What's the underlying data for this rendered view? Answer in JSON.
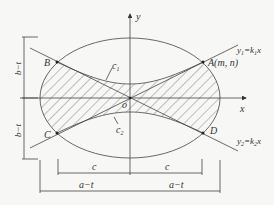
{
  "diagram": {
    "axes": {
      "x_label": "x",
      "y_label": "y",
      "origin_label": "o"
    },
    "points": {
      "A": "A(m, n)",
      "B": "B",
      "C": "C",
      "D": "D"
    },
    "curves": {
      "c1": "c",
      "c1_sub": "1",
      "c2": "c",
      "c2_sub": "2"
    },
    "lines": {
      "line1": {
        "lhs": "y",
        "lhs_sub": "1",
        "eq": "=k",
        "k_sub": "1",
        "rhs": "x"
      },
      "line2": {
        "lhs": "y",
        "lhs_sub": "2",
        "eq": "=k",
        "k_sub": "2",
        "rhs": "x"
      }
    },
    "dimensions": {
      "left_top": "b−t",
      "left_bottom": "b−t",
      "bottom_c_left": "c",
      "bottom_c_right": "c",
      "bottom_a_left": "a−t",
      "bottom_a_right": "a−t"
    },
    "hatched_region": "region between curves c1, c2 and ellipse"
  }
}
